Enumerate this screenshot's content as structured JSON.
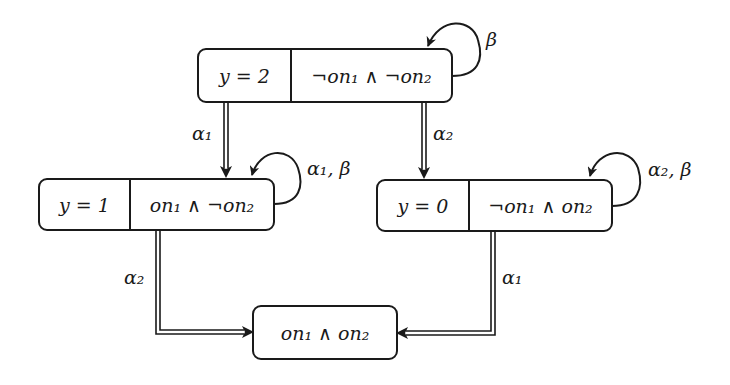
{
  "diagram": {
    "type": "state-transition",
    "nodes": [
      {
        "id": "s2",
        "y_label": "y = 2",
        "condition": "¬on₁ ∧ ¬on₂"
      },
      {
        "id": "s1",
        "y_label": "y = 1",
        "condition": "on₁ ∧ ¬on₂"
      },
      {
        "id": "s0",
        "y_label": "y = 0",
        "condition": "¬on₁ ∧ on₂"
      },
      {
        "id": "sf",
        "condition": "on₁ ∧ on₂"
      }
    ],
    "edges": [
      {
        "from": "s2",
        "to": "s2",
        "label": "β",
        "style": "self-loop"
      },
      {
        "from": "s2",
        "to": "s1",
        "label": "α₁",
        "style": "double"
      },
      {
        "from": "s2",
        "to": "s0",
        "label": "α₂",
        "style": "double"
      },
      {
        "from": "s1",
        "to": "s1",
        "label": "α₁, β",
        "style": "self-loop"
      },
      {
        "from": "s0",
        "to": "s0",
        "label": "α₂, β",
        "style": "self-loop"
      },
      {
        "from": "s1",
        "to": "sf",
        "label": "α₂",
        "style": "double"
      },
      {
        "from": "s0",
        "to": "sf",
        "label": "α₁",
        "style": "double"
      }
    ]
  }
}
